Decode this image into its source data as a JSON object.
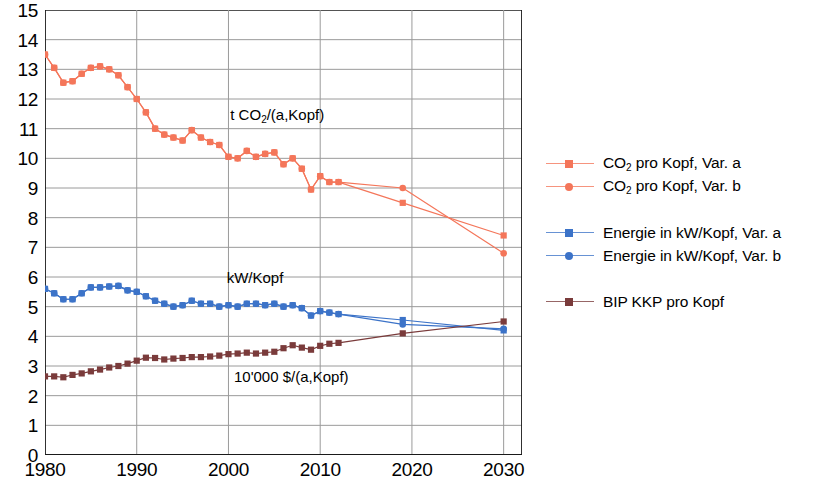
{
  "chart_data": {
    "type": "line",
    "title": "",
    "xlabel": "",
    "ylabel": "",
    "xlim": [
      1980,
      2032
    ],
    "ylim": [
      0,
      15
    ],
    "grid": true,
    "yticks": [
      0,
      1,
      2,
      3,
      4,
      5,
      6,
      7,
      8,
      9,
      10,
      11,
      12,
      13,
      14,
      15
    ],
    "xticks": [
      1980,
      1990,
      2000,
      2010,
      2020,
      2030
    ],
    "xtick_labels": [
      "1980",
      "1990",
      "2000",
      "2010",
      "2020",
      "2030"
    ],
    "ytick_labels": [
      "0",
      "1",
      "2",
      "3",
      "4",
      "5",
      "6",
      "7",
      "8",
      "9",
      "10",
      "11",
      "12",
      "13",
      "14",
      "15"
    ],
    "x_minor_ticks": [
      1985,
      1995,
      2005,
      2015,
      2025
    ],
    "legend_position": "right",
    "annotations": [
      {
        "text": "t CO2/(a,Kopf)",
        "html": "t CO<sub>2</sub>/(a,Kopf)",
        "x": 2000.2,
        "y": 11.45
      },
      {
        "text": "kW/Kopf",
        "html": "kW/Kopf",
        "x": 1999.8,
        "y": 5.95
      },
      {
        "text": "10'000 $/(a,Kopf)",
        "html": "10'000 $/(a,Kopf)",
        "x": 2000.6,
        "y": 2.62
      }
    ],
    "series": [
      {
        "name": "CO2 pro Kopf, Var. a",
        "color": "#F4765A",
        "marker": "square",
        "x": [
          1980,
          1981,
          1982,
          1983,
          1984,
          1985,
          1986,
          1987,
          1988,
          1989,
          1990,
          1991,
          1992,
          1993,
          1994,
          1995,
          1996,
          1997,
          1998,
          1999,
          2000,
          2001,
          2002,
          2003,
          2004,
          2005,
          2006,
          2007,
          2008,
          2009,
          2010,
          2011,
          2012,
          2019,
          2030
        ],
        "values": [
          13.5,
          13.05,
          12.55,
          12.6,
          12.85,
          13.05,
          13.1,
          13.0,
          12.8,
          12.4,
          12.0,
          11.55,
          11.0,
          10.8,
          10.7,
          10.6,
          10.95,
          10.7,
          10.55,
          10.45,
          10.05,
          10.0,
          10.25,
          10.05,
          10.15,
          10.2,
          9.8,
          10.0,
          9.65,
          8.95,
          9.4,
          9.2,
          9.2,
          8.5,
          7.4
        ]
      },
      {
        "name": "CO2 pro Kopf, Var. b",
        "color": "#F4765A",
        "marker": "circle",
        "x": [
          1980,
          1981,
          1982,
          1983,
          1984,
          1985,
          1986,
          1987,
          1988,
          1989,
          1990,
          1991,
          1992,
          1993,
          1994,
          1995,
          1996,
          1997,
          1998,
          1999,
          2000,
          2001,
          2002,
          2003,
          2004,
          2005,
          2006,
          2007,
          2008,
          2009,
          2010,
          2011,
          2012,
          2019,
          2030
        ],
        "values": [
          13.5,
          13.05,
          12.55,
          12.6,
          12.85,
          13.05,
          13.1,
          13.0,
          12.8,
          12.4,
          12.0,
          11.55,
          11.0,
          10.8,
          10.7,
          10.6,
          10.95,
          10.7,
          10.55,
          10.45,
          10.05,
          10.0,
          10.25,
          10.05,
          10.15,
          10.2,
          9.8,
          10.0,
          9.65,
          8.95,
          9.4,
          9.2,
          9.2,
          9.0,
          6.8
        ]
      },
      {
        "name": "Energie in kW/Kopf, Var. a",
        "color": "#3C73C8",
        "marker": "square",
        "x": [
          1980,
          1981,
          1982,
          1983,
          1984,
          1985,
          1986,
          1987,
          1988,
          1989,
          1990,
          1991,
          1992,
          1993,
          1994,
          1995,
          1996,
          1997,
          1998,
          1999,
          2000,
          2001,
          2002,
          2003,
          2004,
          2005,
          2006,
          2007,
          2008,
          2009,
          2010,
          2011,
          2012,
          2019,
          2030
        ],
        "values": [
          5.6,
          5.45,
          5.25,
          5.25,
          5.45,
          5.65,
          5.65,
          5.68,
          5.7,
          5.55,
          5.5,
          5.35,
          5.2,
          5.1,
          5.0,
          5.05,
          5.2,
          5.1,
          5.1,
          5.0,
          5.05,
          5.0,
          5.1,
          5.1,
          5.05,
          5.1,
          5.0,
          5.05,
          4.95,
          4.7,
          4.85,
          4.8,
          4.75,
          4.55,
          4.2
        ]
      },
      {
        "name": "Energie in kW/Kopf, Var. b",
        "color": "#3C73C8",
        "marker": "circle",
        "x": [
          1980,
          1981,
          1982,
          1983,
          1984,
          1985,
          1986,
          1987,
          1988,
          1989,
          1990,
          1991,
          1992,
          1993,
          1994,
          1995,
          1996,
          1997,
          1998,
          1999,
          2000,
          2001,
          2002,
          2003,
          2004,
          2005,
          2006,
          2007,
          2008,
          2009,
          2010,
          2011,
          2012,
          2019,
          2030
        ],
        "values": [
          5.6,
          5.45,
          5.25,
          5.25,
          5.45,
          5.65,
          5.65,
          5.68,
          5.7,
          5.55,
          5.5,
          5.35,
          5.2,
          5.1,
          5.0,
          5.05,
          5.2,
          5.1,
          5.1,
          5.0,
          5.05,
          5.0,
          5.1,
          5.1,
          5.05,
          5.1,
          5.0,
          5.05,
          4.95,
          4.7,
          4.85,
          4.8,
          4.75,
          4.4,
          4.25
        ]
      },
      {
        "name": "BIP KKP pro Kopf",
        "color": "#7A3B3B",
        "marker": "square",
        "x": [
          1980,
          1981,
          1982,
          1983,
          1984,
          1985,
          1986,
          1987,
          1988,
          1989,
          1990,
          1991,
          1992,
          1993,
          1994,
          1995,
          1996,
          1997,
          1998,
          1999,
          2000,
          2001,
          2002,
          2003,
          2004,
          2005,
          2006,
          2007,
          2008,
          2009,
          2010,
          2011,
          2012,
          2019,
          2030
        ],
        "values": [
          2.65,
          2.65,
          2.62,
          2.7,
          2.75,
          2.82,
          2.88,
          2.95,
          3.0,
          3.08,
          3.18,
          3.28,
          3.27,
          3.22,
          3.25,
          3.27,
          3.3,
          3.3,
          3.32,
          3.35,
          3.4,
          3.42,
          3.45,
          3.42,
          3.45,
          3.48,
          3.6,
          3.7,
          3.62,
          3.55,
          3.68,
          3.75,
          3.78,
          4.1,
          4.5
        ]
      }
    ]
  },
  "legend": {
    "groups": [
      {
        "entries": [
          {
            "label": "CO2 pro Kopf, Var. a",
            "label_html": "CO<sub>2</sub> pro Kopf, Var. a",
            "color": "#F4765A",
            "marker": "square"
          },
          {
            "label": "CO2 pro Kopf, Var. b",
            "label_html": "CO<sub>2</sub> pro Kopf, Var. b",
            "color": "#F4765A",
            "marker": "circle"
          }
        ]
      },
      {
        "entries": [
          {
            "label": "Energie in kW/Kopf, Var. a",
            "label_html": "Energie in kW/Kopf, Var. a",
            "color": "#3C73C8",
            "marker": "square"
          },
          {
            "label": "Energie in kW/Kopf, Var. b",
            "label_html": "Energie in kW/Kopf, Var. b",
            "color": "#3C73C8",
            "marker": "circle"
          }
        ]
      },
      {
        "entries": [
          {
            "label": "BIP KKP pro Kopf",
            "label_html": "BIP KKP pro Kopf",
            "color": "#7A3B3B",
            "marker": "square"
          }
        ]
      }
    ]
  },
  "colors": {
    "co2": "#F4765A",
    "energie": "#3C73C8",
    "bip": "#7A3B3B",
    "axis": "#1a1a1a",
    "grid": "#9a9a9a",
    "background": "#ffffff"
  }
}
